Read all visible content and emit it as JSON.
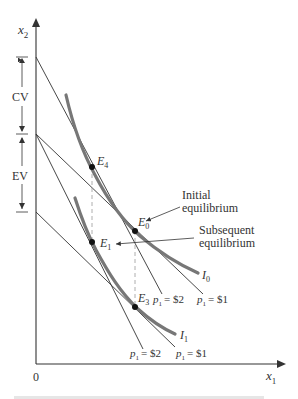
{
  "diagram": {
    "axes": {
      "x_label": "x",
      "x_sub": "1",
      "y_label": "x",
      "y_sub": "2",
      "origin": "0"
    },
    "brackets": {
      "cv_label": "CV",
      "ev_label": "EV"
    },
    "curves": {
      "i0_label": "I",
      "i0_sub": "0",
      "i1_label": "I",
      "i1_sub": "1"
    },
    "points": {
      "e4_label": "E",
      "e4_sub": "4",
      "e0_label": "E",
      "e0_sub": "0",
      "e1_label": "E",
      "e1_sub": "1",
      "e3_label": "E",
      "e3_sub": "3"
    },
    "annotations": {
      "initial_line1": "Initial",
      "initial_line2": "equilibrium",
      "subsequent_line1": "Subsequent",
      "subsequent_line2": "equilibrium"
    },
    "budget_labels": {
      "p": "p",
      "sub": "1",
      "upper_left": "= $2",
      "upper_right": "= $1",
      "lower_left": "= $2",
      "lower_right": "= $1"
    },
    "colors": {
      "ink": "#333333",
      "indifference_curve": "#777777",
      "dashed_guide": "#999999"
    }
  }
}
